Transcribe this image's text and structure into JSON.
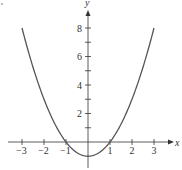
{
  "chart_data": {
    "type": "line",
    "title": "",
    "function": "y = x^2 - 1",
    "xlabel": "x",
    "ylabel": "y",
    "xlim": [
      -3,
      3
    ],
    "ylim": [
      -1,
      8
    ],
    "x_ticks": [
      -3,
      -2,
      -1,
      1,
      2,
      3
    ],
    "x_tick_labels": [
      "−3",
      "−2",
      "−1",
      "1",
      "2",
      "3"
    ],
    "y_ticks": [
      1,
      2,
      3,
      4,
      5,
      6,
      7,
      8
    ],
    "y_tick_labels": [
      "2",
      "4",
      "6",
      "8"
    ],
    "y_labeled_ticks": [
      2,
      4,
      6,
      8
    ],
    "grid": false,
    "legend": null,
    "series": [
      {
        "name": "parabola",
        "x": [
          -3,
          -2.5,
          -2,
          -1.5,
          -1,
          -0.5,
          0,
          0.5,
          1,
          1.5,
          2,
          2.5,
          3
        ],
        "y": [
          8,
          5.25,
          3,
          1.25,
          0,
          -0.75,
          -1,
          -0.75,
          0,
          1.25,
          3,
          5.25,
          8
        ]
      }
    ],
    "colors": {
      "curve": "#555555",
      "axes": "#333333"
    }
  }
}
